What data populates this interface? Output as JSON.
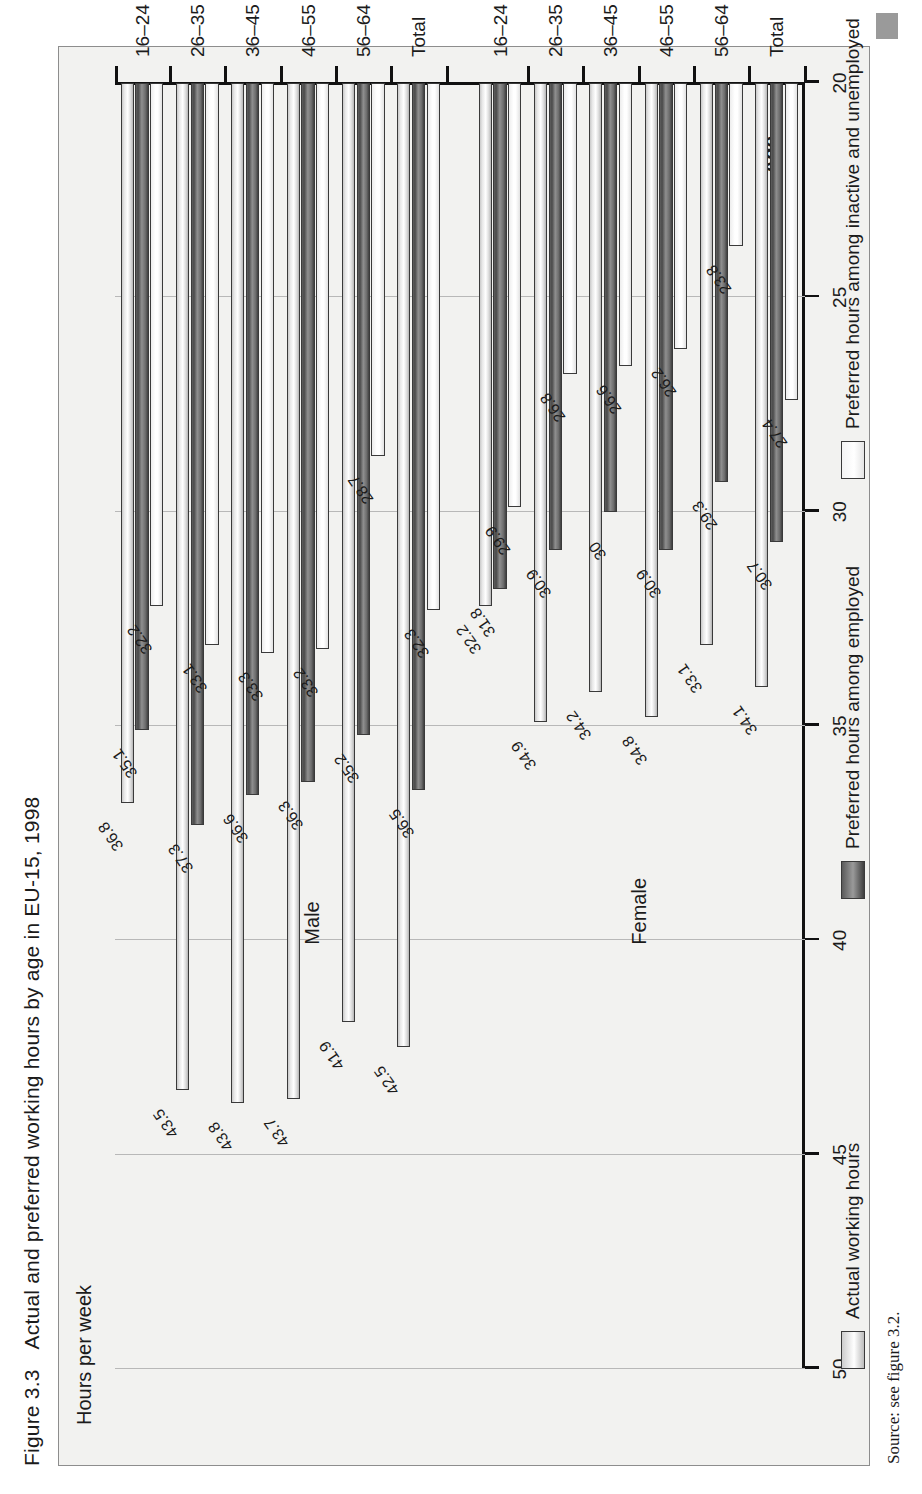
{
  "figure": {
    "number": "Figure 3.3",
    "title": "Actual and preferred working hours by age in EU-15, 1998",
    "source": "Source: see figure 3.2."
  },
  "chart_data": {
    "type": "bar",
    "orientation": "horizontal",
    "title": "Actual and preferred working hours by age in EU-15, 1998",
    "xlabel": "Age",
    "ylabel": "Hours per week",
    "ylim": [
      20,
      50
    ],
    "yticks": [
      20,
      25,
      30,
      35,
      40,
      45,
      50
    ],
    "grid": true,
    "legend_position": "bottom",
    "group_labels": [
      "Male",
      "Female"
    ],
    "categories": [
      "Male 16–24",
      "Male 26–35",
      "Male 36–45",
      "Male 46–55",
      "Male 56–64",
      "Male Total",
      "Female 16–24",
      "Female 26–35",
      "Female 36–45",
      "Female 46–55",
      "Female 56–64",
      "Female Total"
    ],
    "age_ticks": [
      "16–24",
      "26–35",
      "36–45",
      "46–55",
      "56–64",
      "Total"
    ],
    "series": [
      {
        "name": "Actual working hours",
        "key": "actual",
        "values": [
          36.8,
          43.5,
          43.8,
          43.7,
          41.9,
          42.5,
          32.2,
          34.9,
          34.2,
          34.8,
          33.1,
          34.1
        ]
      },
      {
        "name": "Preferred hours among employed",
        "key": "emp",
        "values": [
          35.1,
          37.3,
          36.6,
          36.3,
          35.2,
          36.5,
          31.8,
          30.9,
          30.0,
          30.9,
          29.3,
          30.7
        ]
      },
      {
        "name": "Preferred hours among inactive and unemployed",
        "key": "inact",
        "values": [
          32.2,
          33.1,
          33.3,
          33.2,
          28.7,
          32.3,
          29.9,
          26.8,
          26.6,
          26.2,
          23.8,
          27.4
        ]
      }
    ],
    "labels": {
      "male": {
        "16–24": [
          "36.8",
          "35.1",
          "32.2"
        ],
        "26–35": [
          "43.5",
          "37.3",
          "33.1"
        ],
        "36–45": [
          "43.8",
          "36.6",
          "33.3"
        ],
        "46–55": [
          "43.7",
          "36.3",
          "33.2"
        ],
        "56–64": [
          "41.9",
          "35.2",
          "28.7"
        ],
        "Total": [
          "42.5",
          "36.5",
          "32.3"
        ]
      },
      "female": {
        "16–24": [
          "32.2",
          "31.8",
          "29.9"
        ],
        "26–35": [
          "34.9",
          "30.9",
          "26.8"
        ],
        "36–45": [
          "34.2",
          "30",
          "26.6"
        ],
        "46–55": [
          "34.8",
          "30.9",
          "26.2"
        ],
        "56–64": [
          "33.1",
          "29.3",
          "23.8"
        ],
        "Total": [
          "34.1",
          "30.7",
          "27.4"
        ]
      }
    }
  },
  "legend": [
    {
      "label": "Actual working hours",
      "key": "actual"
    },
    {
      "label": "Preferred hours among employed",
      "key": "emp"
    },
    {
      "label": "Preferred hours among inactive and unemployed",
      "key": "inact"
    }
  ],
  "colors": {
    "panel_bg": "#f2f2f0",
    "axis": "#111111",
    "grid": "#b8b8b8",
    "actual_bar": "#ffffff",
    "employed_bar": "#6d6d6d",
    "inactive_bar": "#ffffff"
  }
}
